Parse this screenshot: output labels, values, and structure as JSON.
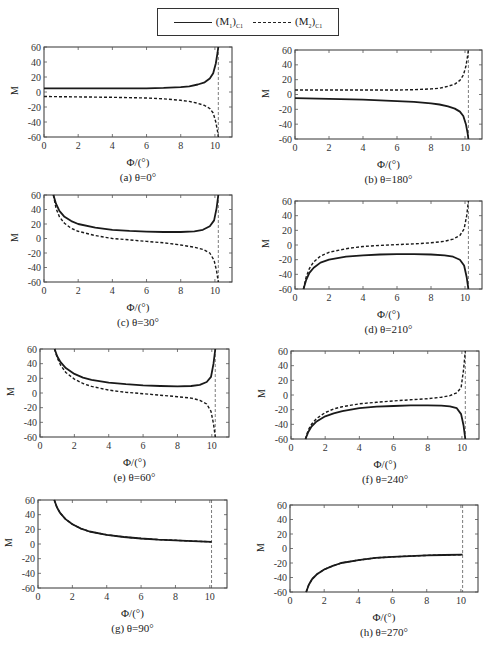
{
  "legend": {
    "items": [
      {
        "label": "(M",
        "sub_index": "1",
        "close": ")",
        "sub": "C1",
        "style": "solid"
      },
      {
        "label": "(M",
        "sub_index": "2",
        "close": ")",
        "sub": "C1",
        "style": "dashed"
      }
    ]
  },
  "chart_data": [
    {
      "id": "a",
      "type": "line",
      "caption": "(a)  θ=0°",
      "xlabel": "Φ/(°)",
      "ylabel": "M",
      "xlim": [
        0,
        11
      ],
      "ylim": [
        -60,
        60
      ],
      "xticks": [
        0,
        2,
        4,
        6,
        8,
        10
      ],
      "yticks": [
        60,
        40,
        20,
        0,
        -20,
        -40,
        -60
      ],
      "asymptote_x": 10.2,
      "series": [
        {
          "name": "(M1)C1",
          "style": "solid",
          "x": [
            0,
            2,
            4,
            6,
            7,
            8,
            8.5,
            9,
            9.4,
            9.7,
            9.9,
            10.05,
            10.15,
            10.2
          ],
          "y": [
            5,
            5,
            5,
            5,
            5.5,
            6.5,
            7.5,
            10,
            13,
            18,
            25,
            38,
            52,
            60
          ]
        },
        {
          "name": "(M2)C1",
          "style": "dashed",
          "x": [
            0,
            2,
            4,
            6,
            7,
            8,
            8.5,
            9,
            9.4,
            9.7,
            9.9,
            10.05,
            10.15,
            10.2
          ],
          "y": [
            -6,
            -6.5,
            -7,
            -8,
            -9,
            -11,
            -12.5,
            -15,
            -18,
            -22,
            -28,
            -40,
            -52,
            -60
          ]
        }
      ]
    },
    {
      "id": "b",
      "type": "line",
      "caption": "(b)  θ=180°",
      "xlabel": "Φ/(°)",
      "ylabel": "M",
      "xlim": [
        0,
        11
      ],
      "ylim": [
        -60,
        60
      ],
      "xticks": [
        0,
        2,
        4,
        6,
        8,
        10
      ],
      "yticks": [
        60,
        40,
        20,
        0,
        -20,
        -40,
        -60
      ],
      "asymptote_x": 10.2,
      "series": [
        {
          "name": "(M1)C1",
          "style": "solid",
          "x": [
            0,
            2,
            4,
            6,
            7,
            8,
            8.5,
            9,
            9.4,
            9.7,
            9.9,
            10.05,
            10.15,
            10.2
          ],
          "y": [
            -5,
            -6,
            -7,
            -9,
            -10,
            -12,
            -13.5,
            -16,
            -19,
            -23,
            -29,
            -40,
            -52,
            -60
          ]
        },
        {
          "name": "(M2)C1",
          "style": "dashed",
          "x": [
            0,
            2,
            4,
            6,
            7,
            8,
            8.5,
            9,
            9.4,
            9.7,
            9.9,
            10.05,
            10.15,
            10.2
          ],
          "y": [
            6,
            6,
            6,
            6,
            6.5,
            7.5,
            8.5,
            11,
            14,
            19,
            26,
            38,
            52,
            60
          ]
        }
      ]
    },
    {
      "id": "c",
      "type": "line",
      "caption": "(c)  θ=30°",
      "xlabel": "Φ/(°)",
      "ylabel": "M",
      "xlim": [
        0,
        11
      ],
      "ylim": [
        -60,
        60
      ],
      "xticks": [
        0,
        2,
        4,
        6,
        8,
        10
      ],
      "yticks": [
        60,
        40,
        20,
        0,
        -20,
        -40,
        -60
      ],
      "asymptote_x": 10.2,
      "series": [
        {
          "name": "(M1)C1",
          "style": "solid",
          "x": [
            0.55,
            0.7,
            0.9,
            1.2,
            1.6,
            2,
            3,
            4,
            5,
            6,
            7,
            8,
            8.8,
            9.3,
            9.7,
            9.95,
            10.1,
            10.2
          ],
          "y": [
            60,
            48,
            38,
            30,
            24,
            20,
            15,
            12,
            10.5,
            9.5,
            9,
            9,
            10,
            12,
            17,
            25,
            42,
            60
          ]
        },
        {
          "name": "(M2)C1",
          "style": "dashed",
          "x": [
            0.55,
            0.7,
            0.9,
            1.2,
            1.6,
            2,
            3,
            4,
            5,
            6,
            7,
            8,
            8.8,
            9.3,
            9.7,
            9.95,
            10.1,
            10.2
          ],
          "y": [
            60,
            42,
            30,
            21,
            14,
            10,
            4,
            0,
            -2,
            -4,
            -6,
            -9,
            -12,
            -15,
            -20,
            -30,
            -45,
            -60
          ]
        }
      ]
    },
    {
      "id": "d",
      "type": "line",
      "caption": "(d)  θ=210°",
      "xlabel": "Φ/(°)",
      "ylabel": "M",
      "xlim": [
        0,
        11
      ],
      "ylim": [
        -60,
        60
      ],
      "xticks": [
        0,
        2,
        4,
        6,
        8,
        10
      ],
      "yticks": [
        60,
        40,
        20,
        0,
        -20,
        -40,
        -60
      ],
      "asymptote_x": 10.2,
      "series": [
        {
          "name": "(M1)C1",
          "style": "solid",
          "x": [
            0.5,
            0.65,
            0.85,
            1.1,
            1.5,
            2,
            3,
            4,
            5,
            6,
            7,
            8,
            8.8,
            9.3,
            9.7,
            9.95,
            10.1,
            10.2
          ],
          "y": [
            -60,
            -48,
            -38,
            -31,
            -24,
            -20,
            -16,
            -14,
            -13,
            -12.5,
            -12.5,
            -13,
            -14,
            -16,
            -20,
            -28,
            -44,
            -60
          ]
        },
        {
          "name": "(M2)C1",
          "style": "dashed",
          "x": [
            0.5,
            0.65,
            0.85,
            1.1,
            1.5,
            2,
            3,
            4,
            5,
            6,
            7,
            8,
            8.8,
            9.3,
            9.7,
            9.95,
            10.1,
            10.2
          ],
          "y": [
            -60,
            -44,
            -32,
            -23,
            -15,
            -10,
            -5,
            -2,
            -0.5,
            0.5,
            1.5,
            3,
            5,
            8,
            13,
            22,
            40,
            60
          ]
        }
      ]
    },
    {
      "id": "e",
      "type": "line",
      "caption": "(e)  θ=60°",
      "xlabel": "Φ/(°)",
      "ylabel": "M",
      "xlim": [
        0,
        11
      ],
      "ylim": [
        -60,
        60
      ],
      "xticks": [
        0,
        2,
        4,
        6,
        8,
        10
      ],
      "yticks": [
        60,
        40,
        20,
        0,
        -20,
        -40,
        -60
      ],
      "asymptote_x": 10.2,
      "series": [
        {
          "name": "(M1)C1",
          "style": "solid",
          "x": [
            0.85,
            1,
            1.2,
            1.5,
            2,
            2.5,
            3,
            4,
            5,
            6,
            7,
            8,
            8.8,
            9.3,
            9.7,
            9.95,
            10.1,
            10.2
          ],
          "y": [
            60,
            50,
            42,
            34,
            26,
            21,
            18,
            14,
            12,
            10.5,
            9.5,
            9,
            9.5,
            11,
            15,
            22,
            40,
            60
          ]
        },
        {
          "name": "(M2)C1",
          "style": "dashed",
          "x": [
            0.85,
            1,
            1.2,
            1.5,
            2,
            2.5,
            3,
            4,
            5,
            6,
            7,
            8,
            8.8,
            9.3,
            9.7,
            9.95,
            10.1,
            10.2
          ],
          "y": [
            60,
            48,
            38,
            28,
            19,
            13,
            9,
            4,
            1,
            -1,
            -3,
            -5,
            -7,
            -10,
            -15,
            -25,
            -42,
            -60
          ]
        }
      ]
    },
    {
      "id": "f",
      "type": "line",
      "caption": "(f)  θ=240°",
      "xlabel": "Φ/(°)",
      "ylabel": "M",
      "xlim": [
        0,
        11
      ],
      "ylim": [
        -60,
        60
      ],
      "xticks": [
        0,
        2,
        4,
        6,
        8,
        10
      ],
      "yticks": [
        60,
        40,
        20,
        0,
        -20,
        -40,
        -60
      ],
      "asymptote_x": 10.2,
      "series": [
        {
          "name": "(M1)C1",
          "style": "solid",
          "x": [
            0.85,
            1,
            1.2,
            1.5,
            2,
            2.5,
            3,
            4,
            5,
            6,
            7,
            8,
            8.8,
            9.3,
            9.7,
            9.95,
            10.1,
            10.2
          ],
          "y": [
            -60,
            -51,
            -43,
            -36,
            -29,
            -25,
            -22,
            -18,
            -16,
            -15,
            -14,
            -14,
            -14.5,
            -15.5,
            -18,
            -26,
            -42,
            -60
          ]
        },
        {
          "name": "(M2)C1",
          "style": "dashed",
          "x": [
            0.85,
            1,
            1.2,
            1.5,
            2,
            2.5,
            3,
            4,
            5,
            6,
            7,
            8,
            8.8,
            9.3,
            9.7,
            9.95,
            10.1,
            10.2
          ],
          "y": [
            -60,
            -48,
            -40,
            -32,
            -24,
            -19,
            -16,
            -12,
            -10,
            -8,
            -6.5,
            -5,
            -3,
            -1,
            3,
            10,
            35,
            60
          ]
        }
      ]
    },
    {
      "id": "g",
      "type": "line",
      "caption": "(g)  θ=90°",
      "xlabel": "Φ/(°)",
      "ylabel": "M",
      "xlim": [
        0,
        11
      ],
      "ylim": [
        -60,
        60
      ],
      "xticks": [
        0,
        2,
        4,
        6,
        8,
        10
      ],
      "yticks": [
        60,
        40,
        20,
        0,
        -20,
        -40,
        -60
      ],
      "asymptote_x": 10.1,
      "series": [
        {
          "name": "(M1)C1",
          "style": "solid",
          "x": [
            0.95,
            1.1,
            1.3,
            1.6,
            2,
            2.5,
            3,
            4,
            5,
            6,
            7,
            8,
            9,
            10.1
          ],
          "y": [
            60,
            50,
            42,
            34,
            27,
            21,
            17,
            12.5,
            9.5,
            7.5,
            6,
            5,
            4,
            3
          ]
        },
        {
          "name": "(M2)C1",
          "style": "dashed",
          "x": [
            0.95,
            1.1,
            1.3,
            1.6,
            2,
            2.5,
            3,
            4,
            5,
            6,
            7,
            8,
            9,
            10.1
          ],
          "y": [
            60,
            50,
            42,
            34,
            27,
            21,
            17,
            12.5,
            9.5,
            7.5,
            6,
            5,
            4,
            3
          ]
        }
      ]
    },
    {
      "id": "h",
      "type": "line",
      "caption": "(h)  θ=270°",
      "xlabel": "Φ/(°)",
      "ylabel": "M",
      "xlim": [
        0,
        11
      ],
      "ylim": [
        -60,
        60
      ],
      "xticks": [
        0,
        2,
        4,
        6,
        8,
        10
      ],
      "yticks": [
        60,
        40,
        20,
        0,
        -20,
        -40,
        -60
      ],
      "asymptote_x": 10.1,
      "series": [
        {
          "name": "(M1)C1",
          "style": "solid",
          "x": [
            0.95,
            1.1,
            1.3,
            1.6,
            2,
            2.5,
            3,
            4,
            5,
            6,
            7,
            8,
            9,
            10.1
          ],
          "y": [
            -60,
            -50,
            -42,
            -35,
            -29,
            -24,
            -20,
            -16,
            -13,
            -11.5,
            -10.5,
            -9.5,
            -9,
            -8.5
          ]
        },
        {
          "name": "(M2)C1",
          "style": "dashed",
          "x": [
            0.95,
            1.1,
            1.3,
            1.6,
            2,
            2.5,
            3,
            4,
            5,
            6,
            7,
            8,
            9,
            10.1
          ],
          "y": [
            -60,
            -50,
            -42,
            -35,
            -29,
            -24,
            -20,
            -16,
            -13,
            -11.5,
            -10.5,
            -9.5,
            -9,
            -8.5
          ]
        }
      ]
    }
  ],
  "layout": {
    "panels": [
      {
        "id": "a",
        "box": [
          44,
          47,
          188,
          90
        ]
      },
      {
        "id": "b",
        "box": [
          295,
          50,
          187,
          89
        ]
      },
      {
        "id": "c",
        "box": [
          44,
          195,
          188,
          87
        ]
      },
      {
        "id": "d",
        "box": [
          295,
          201,
          187,
          88
        ]
      },
      {
        "id": "e",
        "box": [
          40,
          349,
          189,
          88
        ]
      },
      {
        "id": "f",
        "box": [
          291,
          351,
          188,
          88
        ]
      },
      {
        "id": "g",
        "box": [
          38,
          500,
          189,
          88
        ]
      },
      {
        "id": "h",
        "box": [
          290,
          505,
          188,
          87
        ]
      }
    ]
  }
}
